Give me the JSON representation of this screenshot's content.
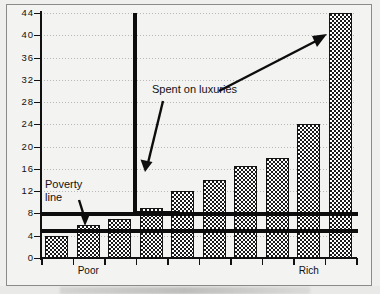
{
  "chart_data": {
    "type": "bar",
    "title": "",
    "subtitle": "",
    "xlabel": "",
    "ylabel": "",
    "ylim": [
      0,
      44
    ],
    "yticks": [
      0,
      4,
      8,
      12,
      16,
      20,
      24,
      28,
      32,
      36,
      40,
      44
    ],
    "grid": true,
    "legend_position": "none",
    "categories": [
      "1",
      "2",
      "3",
      "4",
      "5",
      "6",
      "7",
      "8",
      "9",
      "10"
    ],
    "category_axis_labels": [
      {
        "text": "Poor",
        "at_index": 1
      },
      {
        "text": "Rich",
        "at_index": 8
      }
    ],
    "values": [
      4,
      6,
      7,
      9,
      12,
      14,
      16.5,
      18,
      24,
      44
    ],
    "series": [
      {
        "name": "Income",
        "values": [
          4,
          6,
          7,
          9,
          12,
          14,
          16.5,
          18,
          24,
          44
        ]
      }
    ],
    "reference_lines": [
      {
        "name": "poverty-line",
        "value": 8,
        "style": "thick-solid"
      },
      {
        "name": "subsistence-line",
        "value": 5,
        "style": "thick-solid"
      }
    ],
    "annotations": [
      {
        "name": "poverty-line-label",
        "text": "Poverty\nline",
        "points_to_value": 5
      },
      {
        "name": "luxuries-label",
        "text": "Spent on luxuries",
        "points_to_value": 44
      }
    ],
    "brackets": [
      {
        "name": "luxuries-bracket",
        "from_value": 8,
        "to_value": 44
      }
    ]
  },
  "axis": {
    "y_tick_labels": [
      "44",
      "40",
      "36",
      "32",
      "28",
      "24",
      "20",
      "16",
      "12",
      "8",
      "4",
      "0"
    ]
  },
  "labels": {
    "poor": "Poor",
    "rich": "Rich",
    "poverty_line": "Poverty\nline",
    "spent_on_luxuries": "Spent on luxuries"
  },
  "colors": {
    "ink": "#111111",
    "paper": "#f3f3f1",
    "grid": "#b9b9b7"
  }
}
